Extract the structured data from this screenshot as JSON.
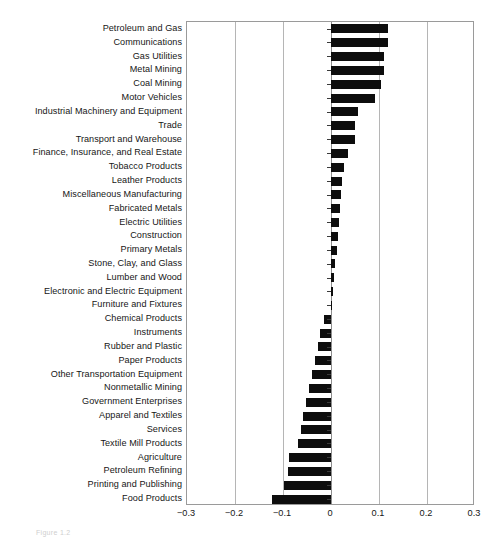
{
  "chart_data": {
    "type": "bar",
    "orientation": "horizontal",
    "title": "",
    "subtitle": "",
    "xlabel": "",
    "ylabel": "",
    "xlim": [
      -0.3,
      0.3
    ],
    "xticks": [
      "-0.3",
      "-0.2",
      "-0.1",
      "0",
      "0.1",
      "0.2",
      "0.3"
    ],
    "xtick_values": [
      -0.3,
      -0.2,
      -0.1,
      0,
      0.1,
      0.2,
      0.3
    ],
    "grid": true,
    "legend": false,
    "bar_color": "#0d0d0d",
    "categories": [
      "Petroleum and Gas",
      "Communications",
      "Gas Utilities",
      "Metal Mining",
      "Coal Mining",
      "Motor Vehicles",
      "Industrial Machinery and Equipment",
      "Trade",
      "Transport and Warehouse",
      "Finance, Insurance, and Real Estate",
      "Tobacco Products",
      "Leather Products",
      "Miscellaneous Manufacturing",
      "Fabricated Metals",
      "Electric Utilities",
      "Construction",
      "Primary Metals",
      "Stone, Clay, and Glass",
      "Lumber and Wood",
      "Electronic and Electric Equipment",
      "Furniture and Fixtures",
      "Chemical Products",
      "Instruments",
      "Rubber and Plastic",
      "Paper Products",
      "Other Transportation Equipment",
      "Nonmetallic Mining",
      "Government Enterprises",
      "Apparel and Textiles",
      "Services",
      "Textile Mill Products",
      "Agriculture",
      "Petroleum Refining",
      "Printing and Publishing",
      "Food Products"
    ],
    "values": [
      0.119,
      0.119,
      0.11,
      0.11,
      0.104,
      0.091,
      0.056,
      0.05,
      0.05,
      0.035,
      0.027,
      0.022,
      0.02,
      0.019,
      0.017,
      0.014,
      0.013,
      0.008,
      0.006,
      0.004,
      0.002,
      -0.014,
      -0.022,
      -0.027,
      -0.033,
      -0.04,
      -0.046,
      -0.052,
      -0.058,
      -0.062,
      -0.068,
      -0.087,
      -0.09,
      -0.098,
      -0.123
    ]
  },
  "caption": {
    "text": "Figure 1.2"
  }
}
